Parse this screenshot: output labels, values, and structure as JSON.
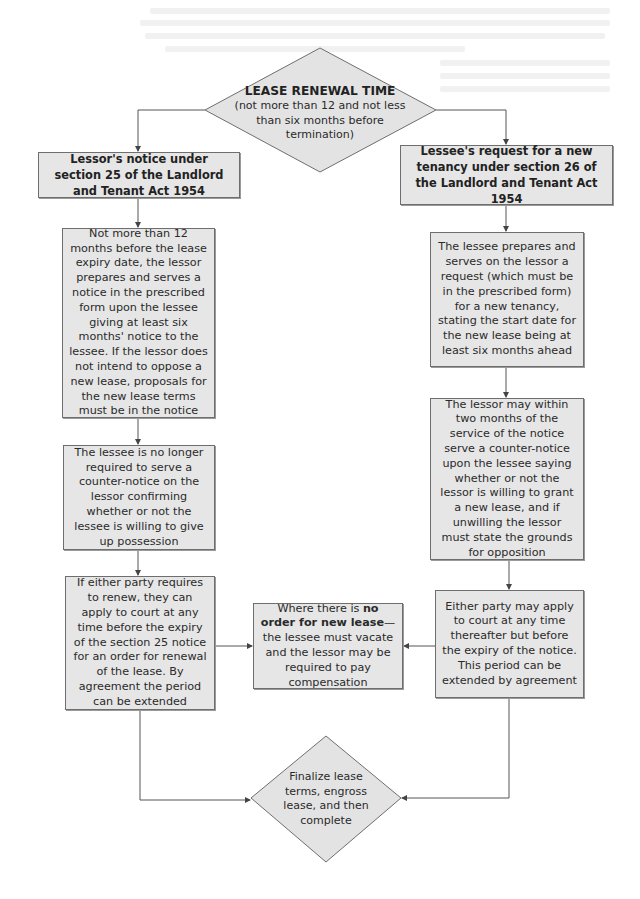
{
  "diagram": {
    "type": "flowchart",
    "colors": {
      "box_fill": "#e6e6e6",
      "border": "#6e6e6e",
      "line": "#555555",
      "background": "#ffffff"
    },
    "start": {
      "title": "LEASE RENEWAL TIME",
      "subtitle": "(not more than 12 and not less than six months before termination)"
    },
    "left_branch": {
      "header": "Lessor's notice under section 25 of the Landlord and Tenant Act 1954",
      "steps": [
        "Not more than 12 months before the lease expiry date, the lessor prepares and serves a notice in the prescribed form upon the lessee giving at least six months' notice to the lessee. If the lessor does not intend to oppose a new lease, proposals for the new lease terms must be in the notice",
        "The lessee is no longer required to serve a counter-notice on the lessor confirming whether or not the lessee is willing to give up possession",
        "If either party requires to renew, they can apply to court at any time before the expiry of the section 25 notice for an order for renewal of the lease. By agreement the period can be extended"
      ]
    },
    "right_branch": {
      "header": "Lessee's request for a new tenancy under section 26 of the Landlord and Tenant Act 1954",
      "steps": [
        "The lessee prepares and serves on the lessor a request (which must be in the prescribed form) for a new tenancy, stating the start date for the new lease being at least six months ahead",
        "The lessor may within two months of the service of the notice serve a counter-notice upon the lessee saying whether or not the lessor is willing to grant a new lease, and if unwilling the lessor must state the grounds for opposition",
        "Either party may apply to court at any time thereafter but before the expiry of the notice. This period can be extended by agreement"
      ]
    },
    "middle": {
      "prefix": "Where there is ",
      "bold": "no order for new lease",
      "suffix": "—the lessee must vacate and the lessor may be required to pay compensation"
    },
    "end": {
      "text": "Finalize lease terms, engross lease, and then complete"
    },
    "edges": [
      {
        "from": "start",
        "to": "left_branch.header"
      },
      {
        "from": "start",
        "to": "right_branch.header"
      },
      {
        "from": "left_branch.header",
        "to": "left_branch.steps.0"
      },
      {
        "from": "left_branch.steps.0",
        "to": "left_branch.steps.1"
      },
      {
        "from": "left_branch.steps.1",
        "to": "left_branch.steps.2"
      },
      {
        "from": "left_branch.steps.2",
        "to": "middle"
      },
      {
        "from": "left_branch.steps.2",
        "to": "end"
      },
      {
        "from": "right_branch.header",
        "to": "right_branch.steps.0"
      },
      {
        "from": "right_branch.steps.0",
        "to": "right_branch.steps.1"
      },
      {
        "from": "right_branch.steps.1",
        "to": "right_branch.steps.2"
      },
      {
        "from": "right_branch.steps.2",
        "to": "middle"
      },
      {
        "from": "right_branch.steps.2",
        "to": "end"
      }
    ]
  }
}
